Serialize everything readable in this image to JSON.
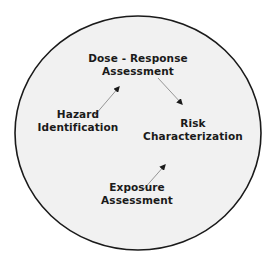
{
  "diagram": {
    "title": "",
    "boundary": {
      "shape": "circle",
      "fill": "#f1f1f1",
      "stroke": "#1a1a1a"
    },
    "nodes": [
      {
        "id": "dose_response",
        "lines": [
          "Dose - Response",
          "Assessment"
        ]
      },
      {
        "id": "hazard_identification",
        "lines": [
          "Hazard",
          "Identification"
        ]
      },
      {
        "id": "risk_characterization",
        "lines": [
          "Risk",
          "Characterization"
        ]
      },
      {
        "id": "exposure_assessment",
        "lines": [
          "Exposure",
          "Assessment"
        ]
      }
    ],
    "edges": [
      {
        "from": "hazard_identification",
        "to": "dose_response"
      },
      {
        "from": "dose_response",
        "to": "risk_characterization"
      },
      {
        "from": "exposure_assessment",
        "to": "risk_characterization"
      }
    ],
    "colors": {
      "arrow": "#8a8a8a",
      "arrowhead": "#1a1a1a",
      "text": "#1a1a1a"
    }
  }
}
